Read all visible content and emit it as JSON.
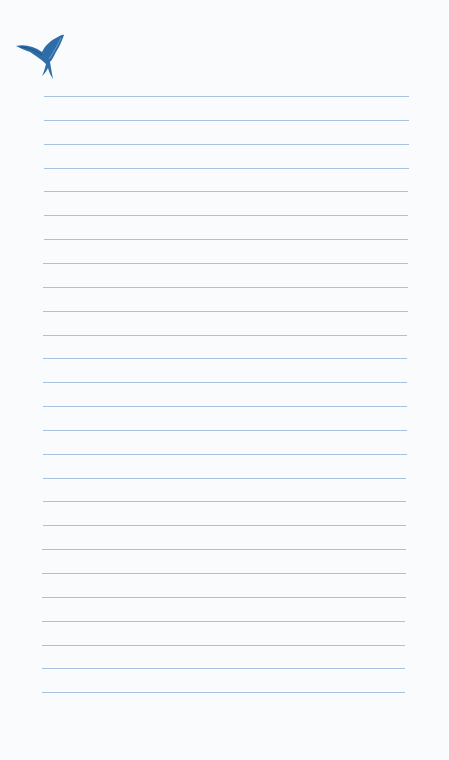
{
  "paper": {
    "icon": "bird-icon",
    "line_color": "#a8c2df",
    "icon_color": "#2f6da8",
    "line_count": 26
  }
}
